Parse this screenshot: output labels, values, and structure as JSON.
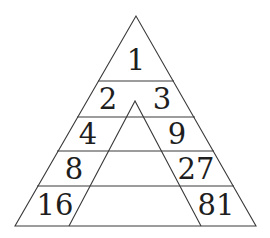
{
  "diagram": {
    "line_color": "#3a3a3a",
    "text_color": "#1e1e1e",
    "rows": [
      {
        "left": "1",
        "right": null
      },
      {
        "left": "2",
        "right": "3"
      },
      {
        "left": "4",
        "right": "9"
      },
      {
        "left": "8",
        "right": "27"
      },
      {
        "left": "16",
        "right": "81"
      }
    ],
    "labels": {
      "top": "1",
      "row2_left": "2",
      "row2_right": "3",
      "row3_left": "4",
      "row3_right": "9",
      "row4_left": "8",
      "row4_right": "27",
      "row5_left": "16",
      "row5_right": "81"
    }
  }
}
